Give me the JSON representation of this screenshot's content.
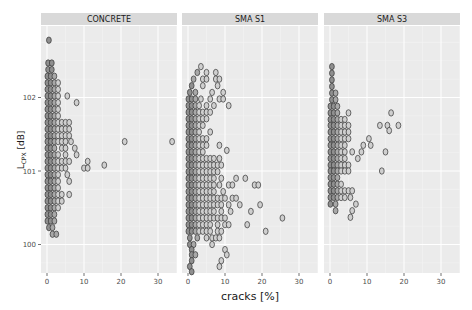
{
  "chart_data": {
    "type": "scatter",
    "subtype": "hex-binned dot plot (facetted)",
    "title": "",
    "xlabel": "cracks [%]",
    "ylabel": "L_CPX [dB]",
    "ylabel_main": "L",
    "ylabel_sub": "CPX",
    "ylabel_unit": " [dB]",
    "xlim": [
      -1,
      36
    ],
    "ylim": [
      99.62,
      102.95
    ],
    "x_ticks": [
      0,
      10,
      20,
      30
    ],
    "y_ticks": [
      100,
      101,
      102
    ],
    "grid": true,
    "legend": null,
    "panels": [
      {
        "name": "CONCRETE",
        "rows": [
          {
            "y": 102.78,
            "x": [
              0.5
            ]
          },
          {
            "y": 102.47,
            "x": [
              0.3,
              1.3
            ]
          },
          {
            "y": 102.38,
            "x": [
              0.3,
              1.3
            ]
          },
          {
            "y": 102.29,
            "x": [
              0.1,
              1.0,
              2.0
            ]
          },
          {
            "y": 102.2,
            "x": [
              0.1,
              1.0,
              2.0,
              3.0
            ]
          },
          {
            "y": 102.11,
            "x": [
              0.1,
              1.0,
              2.0,
              3.0
            ]
          },
          {
            "y": 102.02,
            "x": [
              0.1,
              1.0,
              2.0,
              3.0,
              5.5
            ]
          },
          {
            "y": 101.93,
            "x": [
              0.1,
              1.0,
              2.0,
              3.0,
              8.0
            ]
          },
          {
            "y": 101.84,
            "x": [
              0.1,
              1.0,
              2.0,
              3.0
            ]
          },
          {
            "y": 101.75,
            "x": [
              0.1,
              1.0,
              2.0,
              3.0
            ]
          },
          {
            "y": 101.66,
            "x": [
              0.1,
              1.0,
              2.0,
              3.0,
              4.0,
              5.0,
              6.0
            ]
          },
          {
            "y": 101.57,
            "x": [
              0.1,
              1.0,
              2.0,
              3.0,
              4.0,
              5.0,
              6.0
            ]
          },
          {
            "y": 101.48,
            "x": [
              0.1,
              1.0,
              2.0,
              3.0,
              4.0,
              5.0,
              6.0
            ]
          },
          {
            "y": 101.4,
            "x": [
              0.1,
              1.0,
              2.0,
              3.0,
              4.0,
              5.0,
              6.5,
              21.0,
              33.8
            ]
          },
          {
            "y": 101.31,
            "x": [
              0.1,
              1.0,
              2.0,
              4.0,
              5.0,
              7.5
            ]
          },
          {
            "y": 101.22,
            "x": [
              0.1,
              1.0,
              2.0,
              3.0,
              5.0,
              8.0
            ]
          },
          {
            "y": 101.13,
            "x": [
              0.1,
              1.0,
              2.0,
              3.0,
              4.0,
              5.0,
              6.0,
              11.0
            ]
          },
          {
            "y": 101.08,
            "x": [
              15.5
            ]
          },
          {
            "y": 101.04,
            "x": [
              0.1,
              1.0,
              2.0,
              3.0,
              4.0,
              5.0,
              10.0,
              11.0
            ]
          },
          {
            "y": 100.95,
            "x": [
              0.1,
              1.0,
              2.0,
              3.0,
              5.5
            ]
          },
          {
            "y": 100.86,
            "x": [
              0.1,
              1.0,
              2.0,
              3.0,
              6.0
            ]
          },
          {
            "y": 100.77,
            "x": [
              0.1,
              1.0,
              2.0,
              3.0
            ]
          },
          {
            "y": 100.68,
            "x": [
              0.1,
              1.0,
              2.0,
              3.0,
              4.0,
              6.0
            ]
          },
          {
            "y": 100.59,
            "x": [
              0.1,
              1.0,
              2.0,
              3.0,
              4.0
            ]
          },
          {
            "y": 100.5,
            "x": [
              0.1,
              1.0,
              2.0,
              3.0
            ]
          },
          {
            "y": 100.41,
            "x": [
              0.1,
              1.0,
              2.0
            ]
          },
          {
            "y": 100.32,
            "x": [
              0.1,
              1.0,
              2.0
            ]
          },
          {
            "y": 100.23,
            "x": [
              0.5,
              1.5
            ]
          },
          {
            "y": 100.14,
            "x": [
              1.5,
              2.5
            ]
          }
        ]
      },
      {
        "name": "SMA S1",
        "rows": [
          {
            "y": 102.42,
            "x": [
              3.5
            ]
          },
          {
            "y": 102.34,
            "x": [
              2.5,
              5.0,
              7.5
            ]
          },
          {
            "y": 102.25,
            "x": [
              1.5,
              4.0,
              5.0,
              7.5,
              8.5
            ]
          },
          {
            "y": 102.16,
            "x": [
              1.0,
              4.0,
              8.0
            ]
          },
          {
            "y": 102.07,
            "x": [
              0.5,
              2.0,
              6.5,
              9.5
            ]
          },
          {
            "y": 101.98,
            "x": [
              0.1,
              1.0,
              2.0,
              3.5,
              6.0,
              8.5,
              9.5
            ]
          },
          {
            "y": 101.89,
            "x": [
              0.1,
              1.0,
              2.0,
              3.0,
              5.0,
              7.0,
              11.0
            ]
          },
          {
            "y": 101.8,
            "x": [
              0.1,
              1.0,
              2.0,
              3.0,
              4.0,
              5.0,
              6.0
            ]
          },
          {
            "y": 101.71,
            "x": [
              0.1,
              1.0,
              2.0,
              3.0,
              4.0,
              5.0
            ]
          },
          {
            "y": 101.62,
            "x": [
              0.1,
              1.0,
              2.0,
              3.0,
              4.0
            ]
          },
          {
            "y": 101.53,
            "x": [
              0.1,
              1.0,
              2.0,
              3.0,
              6.0
            ]
          },
          {
            "y": 101.44,
            "x": [
              0.1,
              1.0,
              2.0,
              3.0,
              4.0,
              5.0
            ]
          },
          {
            "y": 101.35,
            "x": [
              0.1,
              1.0,
              2.0,
              3.0,
              4.0,
              5.0,
              8.5
            ]
          },
          {
            "y": 101.28,
            "x": [
              10.5
            ]
          },
          {
            "y": 101.26,
            "x": [
              0.1,
              1.0,
              2.0,
              3.0,
              4.0
            ]
          },
          {
            "y": 101.17,
            "x": [
              0.1,
              1.0,
              2.0,
              3.0,
              4.0,
              5.0,
              6.0,
              7.0,
              8.5
            ]
          },
          {
            "y": 101.08,
            "x": [
              0.1,
              1.0,
              2.0,
              3.0,
              4.0,
              5.0,
              6.0,
              7.0,
              8.0,
              9.0
            ]
          },
          {
            "y": 100.99,
            "x": [
              0.1,
              1.0,
              2.0,
              3.0,
              4.0,
              5.0,
              6.0,
              7.0,
              8.0
            ]
          },
          {
            "y": 100.9,
            "x": [
              0.1,
              1.0,
              2.0,
              3.0,
              4.0,
              5.0,
              6.0,
              7.0,
              9.0,
              13.0,
              15.5
            ]
          },
          {
            "y": 100.81,
            "x": [
              0.1,
              1.0,
              2.0,
              3.0,
              4.0,
              5.0,
              6.0,
              7.0,
              8.5,
              11.0,
              12.0,
              18.0,
              19.0
            ]
          },
          {
            "y": 100.72,
            "x": [
              0.1,
              1.0,
              2.0,
              3.0,
              4.0,
              5.0,
              6.0,
              7.0,
              9.5
            ]
          },
          {
            "y": 100.63,
            "x": [
              0.1,
              1.0,
              2.0,
              3.0,
              4.0,
              5.0,
              6.0,
              7.0,
              8.0,
              9.0,
              10.0,
              12.0,
              13.0
            ]
          },
          {
            "y": 100.54,
            "x": [
              0.1,
              1.0,
              2.0,
              3.0,
              4.0,
              5.0,
              6.0,
              7.0,
              8.0,
              9.0,
              11.0,
              14.0,
              19.5
            ]
          },
          {
            "y": 100.45,
            "x": [
              0.1,
              1.0,
              2.0,
              3.0,
              4.0,
              5.0,
              6.0,
              7.0,
              9.0,
              11.5,
              17.0
            ]
          },
          {
            "y": 100.36,
            "x": [
              0.1,
              1.0,
              2.0,
              3.0,
              4.0,
              5.0,
              6.0,
              7.0,
              8.0,
              9.0,
              10.0,
              25.5
            ]
          },
          {
            "y": 100.27,
            "x": [
              0.1,
              1.0,
              2.0,
              3.0,
              4.0,
              5.0,
              6.0,
              8.0,
              10.0,
              11.0,
              16.0
            ]
          },
          {
            "y": 100.18,
            "x": [
              0.1,
              1.0,
              2.0,
              3.0,
              4.0,
              5.0,
              6.0,
              8.0,
              9.0,
              21.0
            ]
          },
          {
            "y": 100.09,
            "x": [
              0.5,
              2.5,
              5.0,
              6.5,
              7.5,
              8.5
            ]
          },
          {
            "y": 100.0,
            "x": [
              0.5,
              1.5,
              6.5
            ]
          },
          {
            "y": 99.93,
            "x": [
              1.0,
              10.0
            ]
          },
          {
            "y": 99.86,
            "x": [
              1.0,
              2.0,
              10.5
            ]
          },
          {
            "y": 99.78,
            "x": [
              1.0,
              9.0
            ]
          },
          {
            "y": 99.7,
            "x": [
              0.5,
              8.5
            ]
          },
          {
            "y": 99.63,
            "x": [
              1.0
            ]
          }
        ]
      },
      {
        "name": "SMA S3",
        "rows": [
          {
            "y": 102.42,
            "x": [
              0.5
            ]
          },
          {
            "y": 102.33,
            "x": [
              0.5
            ]
          },
          {
            "y": 102.24,
            "x": [
              0.5
            ]
          },
          {
            "y": 102.15,
            "x": [
              0.5
            ]
          },
          {
            "y": 102.06,
            "x": [
              0.5,
              1.5
            ]
          },
          {
            "y": 101.97,
            "x": [
              0.5,
              1.5
            ]
          },
          {
            "y": 101.88,
            "x": [
              0.1,
              1.0,
              2.0
            ]
          },
          {
            "y": 101.79,
            "x": [
              0.1,
              1.0,
              2.0,
              5.0,
              16.5
            ]
          },
          {
            "y": 101.7,
            "x": [
              0.1,
              1.0,
              2.0,
              3.0,
              4.0
            ]
          },
          {
            "y": 101.62,
            "x": [
              0.1,
              1.0,
              2.0,
              3.0,
              4.0,
              5.0,
              13.5,
              15.5,
              18.5
            ]
          },
          {
            "y": 101.55,
            "x": [
              16.0
            ]
          },
          {
            "y": 101.53,
            "x": [
              0.1,
              1.0,
              2.0,
              3.0,
              4.0,
              5.0
            ]
          },
          {
            "y": 101.44,
            "x": [
              0.1,
              1.0,
              2.0,
              3.0,
              4.0,
              5.0,
              10.5
            ]
          },
          {
            "y": 101.35,
            "x": [
              0.1,
              1.0,
              2.0,
              3.0,
              4.0,
              9.0,
              11.0
            ]
          },
          {
            "y": 101.26,
            "x": [
              0.1,
              1.0,
              2.0,
              3.0,
              4.0,
              6.0,
              8.5,
              15.0
            ]
          },
          {
            "y": 101.17,
            "x": [
              0.1,
              1.0,
              2.0,
              3.0,
              4.0,
              7.5
            ]
          },
          {
            "y": 101.08,
            "x": [
              0.1,
              1.0,
              2.0,
              3.0,
              4.0,
              5.0
            ]
          },
          {
            "y": 101.0,
            "x": [
              0.1,
              1.0,
              2.0,
              3.0,
              4.0,
              5.0,
              14.0
            ]
          },
          {
            "y": 100.91,
            "x": [
              0.1,
              1.0,
              2.0
            ]
          },
          {
            "y": 100.82,
            "x": [
              0.1,
              1.0,
              2.0,
              3.0
            ]
          },
          {
            "y": 100.73,
            "x": [
              0.1,
              1.0,
              2.0,
              3.0,
              4.0,
              5.0,
              6.0
            ]
          },
          {
            "y": 100.64,
            "x": [
              0.1,
              1.0,
              2.0,
              3.0,
              4.0,
              5.5
            ]
          },
          {
            "y": 100.55,
            "x": [
              0.1,
              1.5,
              7.0
            ]
          },
          {
            "y": 100.46,
            "x": [
              1.5,
              6.0
            ]
          },
          {
            "y": 100.37,
            "x": [
              5.5
            ]
          }
        ]
      }
    ]
  },
  "style": {
    "panel_bg": "#ebebeb",
    "strip_bg": "#d9d9d9",
    "grid_major": "#ffffff",
    "dot_stroke": "#333333",
    "dot_fill_dense": "#8c8c8c",
    "dot_fill_light": "#d0d0d0"
  }
}
